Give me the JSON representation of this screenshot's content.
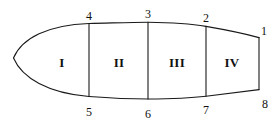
{
  "diagram": {
    "background_color": "#ffffff",
    "stroke_color": "#1a1a1a",
    "label_color": "#111111",
    "shape": "leaf-outline-pointed-left",
    "segment_count": 4,
    "vertex_count": 8
  },
  "segments": [
    {
      "id": "segment-1",
      "label": "I",
      "x": 62,
      "y": 62
    },
    {
      "id": "segment-2",
      "label": "II",
      "x": 119,
      "y": 62
    },
    {
      "id": "segment-3",
      "label": "III",
      "x": 177,
      "y": 62
    },
    {
      "id": "segment-4",
      "label": "IV",
      "x": 232,
      "y": 62
    }
  ],
  "vertices": [
    {
      "id": "vertex-1",
      "label": "1",
      "x": 264,
      "y": 31
    },
    {
      "id": "vertex-2",
      "label": "2",
      "x": 206,
      "y": 18
    },
    {
      "id": "vertex-3",
      "label": "3",
      "x": 148,
      "y": 14
    },
    {
      "id": "vertex-4",
      "label": "4",
      "x": 89,
      "y": 16
    },
    {
      "id": "vertex-5",
      "label": "5",
      "x": 89,
      "y": 112
    },
    {
      "id": "vertex-6",
      "label": "6",
      "x": 148,
      "y": 114
    },
    {
      "id": "vertex-7",
      "label": "7",
      "x": 206,
      "y": 110
    },
    {
      "id": "vertex-8",
      "label": "8",
      "x": 265,
      "y": 104
    }
  ],
  "geometry": {
    "outline_top_path": "M 13.5 58 C 22 38 48 25 89 23.5 C 112 23 131 22.2 148 22.2 C 172 22.4 196 24.6 206 26.4 C 228 30.2 248 34.6 259 37.6",
    "outline_bottom_path": "M 13.5 58 C 22 78 48 93 89 96.5 C 112 98.2 131 99 148 99 C 172 98.8 196 97.4 206 96.2 C 228 93.6 248 91 259 89.6",
    "right_edge_path": "M 259 37.6 L 259 89.6",
    "dividers": [
      {
        "id": "divider-4-5",
        "x": 89,
        "y_top": 23.5,
        "y_bottom": 96.5
      },
      {
        "id": "divider-3-6",
        "x": 148,
        "y_top": 22.2,
        "y_bottom": 99.0
      },
      {
        "id": "divider-2-7",
        "x": 206,
        "y_top": 26.4,
        "y_bottom": 96.2
      }
    ]
  }
}
